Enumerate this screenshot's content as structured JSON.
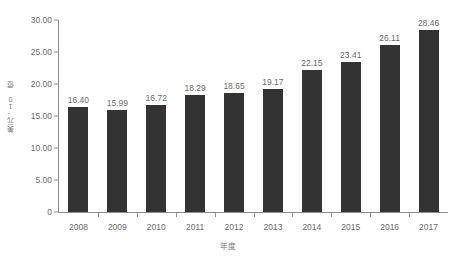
{
  "chart_data": {
    "type": "bar",
    "title": "",
    "xlabel": "年度",
    "ylabel": "美元：10 億",
    "categories": [
      "2008",
      "2009",
      "2010",
      "2011",
      "2012",
      "2013",
      "2014",
      "2015",
      "2016",
      "2017"
    ],
    "values": [
      16.4,
      15.99,
      16.72,
      18.29,
      18.65,
      19.17,
      22.15,
      23.41,
      26.11,
      28.46
    ],
    "value_labels": [
      "16.40",
      "15.99",
      "16.72",
      "18.29",
      "18.65",
      "19.17",
      "22.15",
      "23.41",
      "26.11",
      "28.46"
    ],
    "ylim": [
      0,
      30
    ],
    "yticks": [
      0,
      5,
      10,
      15,
      20,
      25,
      30
    ],
    "ytick_labels": [
      "0",
      "5.00",
      "10.00",
      "15.00",
      "20.00",
      "25.00",
      "30.00"
    ],
    "grid": false,
    "legend": null,
    "bar_color": "#333333",
    "axis_color": "#8c8c8c",
    "text_color": "#6b6b6b",
    "background": "#ffffff"
  }
}
